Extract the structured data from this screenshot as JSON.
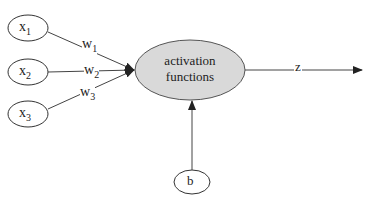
{
  "diagram": {
    "inputs": [
      {
        "label": "x",
        "sub": "1"
      },
      {
        "label": "x",
        "sub": "2"
      },
      {
        "label": "x",
        "sub": "3"
      }
    ],
    "weights": [
      {
        "label": "w",
        "sub": "1"
      },
      {
        "label": "w",
        "sub": "2"
      },
      {
        "label": "w",
        "sub": "3"
      }
    ],
    "node": {
      "line1": "activation",
      "line2": "functions",
      "fill": "#d9d9d9"
    },
    "output": {
      "label": "z"
    },
    "bias": {
      "label": "b"
    }
  }
}
